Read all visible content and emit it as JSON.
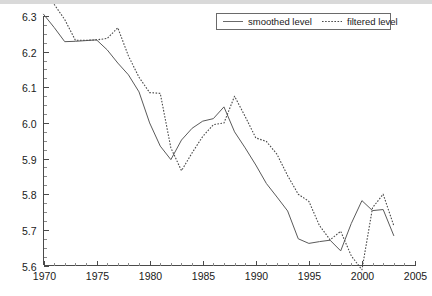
{
  "chart_data": {
    "type": "line",
    "title": "",
    "subtitle": "",
    "xlabel": "",
    "ylabel": "",
    "xlim": [
      1970,
      2005
    ],
    "ylim": [
      5.6,
      6.3
    ],
    "grid": false,
    "legend_position": "top-right",
    "x_ticks": [
      "1970",
      "1975",
      "1980",
      "1985",
      "1990",
      "1995",
      "2000",
      "2005"
    ],
    "x_tick_values": [
      1970,
      1975,
      1980,
      1985,
      1990,
      1995,
      2000,
      2005
    ],
    "x_minor_step": 1,
    "y_ticks": [
      "5.6",
      "5.7",
      "5.8",
      "5.9",
      "6.0",
      "6.1",
      "6.2",
      "6.3"
    ],
    "y_tick_values": [
      5.6,
      5.7,
      5.8,
      5.9,
      6.0,
      6.1,
      6.2,
      6.3
    ],
    "y_minor_step": 0.025,
    "x": [
      1970,
      1971,
      1972,
      1973,
      1974,
      1975,
      1976,
      1977,
      1978,
      1979,
      1980,
      1981,
      1982,
      1983,
      1984,
      1985,
      1986,
      1987,
      1988,
      1989,
      1990,
      1991,
      1992,
      1993,
      1994,
      1995,
      1996,
      1997,
      1998,
      1999,
      2000,
      2001,
      2002,
      2003
    ],
    "series": [
      {
        "name": "smoothed level",
        "style": "solid",
        "color": "#5a5a5a",
        "values": [
          6.305,
          6.268,
          6.228,
          6.229,
          6.231,
          6.233,
          6.205,
          6.168,
          6.135,
          6.087,
          6.0,
          5.935,
          5.897,
          5.952,
          5.985,
          6.005,
          6.012,
          6.045,
          5.975,
          5.93,
          5.882,
          5.83,
          5.792,
          5.753,
          5.675,
          5.662,
          5.667,
          5.671,
          5.641,
          5.718,
          5.782,
          5.754,
          5.757,
          5.684
        ]
      },
      {
        "name": "filtered level",
        "style": "dotted",
        "color": "#4a4a4a",
        "values": [
          null,
          6.333,
          6.29,
          6.232,
          6.232,
          6.233,
          6.237,
          6.267,
          6.188,
          6.128,
          6.085,
          6.083,
          5.93,
          5.866,
          5.916,
          5.962,
          5.995,
          6.0,
          6.075,
          6.018,
          5.958,
          5.948,
          5.912,
          5.852,
          5.8,
          5.78,
          5.712,
          5.672,
          5.696,
          5.627,
          5.588,
          5.762,
          5.8,
          5.712
        ]
      }
    ],
    "legend": [
      {
        "label": "smoothed level",
        "style": "solid"
      },
      {
        "label": "filtered level",
        "style": "dotted"
      }
    ]
  },
  "legend": {
    "smoothed_label": "smoothed level",
    "filtered_label": "filtered level"
  }
}
